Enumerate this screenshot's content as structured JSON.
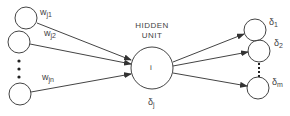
{
  "diagram": {
    "hidden_unit": {
      "title_line1": "HIDDEN",
      "title_line2": "UNIT",
      "inner_label": "i",
      "delta_symbol": "δ",
      "delta_sub": "j"
    },
    "input_weights": [
      {
        "symbol": "w",
        "sub": "j1"
      },
      {
        "symbol": "w",
        "sub": "j2"
      },
      {
        "symbol": "w",
        "sub": "jn"
      }
    ],
    "outputs": [
      {
        "symbol": "δ",
        "sub": "1"
      },
      {
        "symbol": "δ",
        "sub": "2"
      },
      {
        "symbol": "δ",
        "sub": "m"
      }
    ],
    "colors": {
      "stroke": "#444444",
      "text": "#444444",
      "background": "#ffffff"
    }
  }
}
